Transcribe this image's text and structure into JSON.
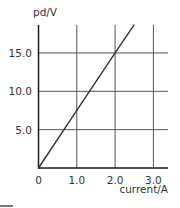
{
  "chart_data": {
    "type": "line",
    "title": "",
    "xlabel": "current/A",
    "ylabel": "pd/V",
    "x_ticks": [
      "0",
      "1.0",
      "2.0",
      "3.0"
    ],
    "y_ticks": [
      "5.0",
      "10.0",
      "15.0"
    ],
    "xlim": [
      0,
      3.4
    ],
    "ylim": [
      0,
      18.7
    ],
    "grid": true,
    "legend": null,
    "series": [
      {
        "name": "pd vs current",
        "x": [
          0,
          1.0,
          2.0,
          2.5
        ],
        "y": [
          0,
          7.5,
          15.0,
          18.7
        ]
      }
    ],
    "colors": {
      "axis": "#1a1a1a",
      "grid": "#555555",
      "line": "#333333",
      "text": "#333333"
    }
  }
}
